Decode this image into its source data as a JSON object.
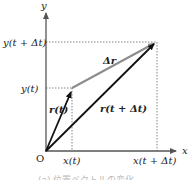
{
  "diagram": {
    "axes": {
      "x_label": "x",
      "y_label": "y",
      "origin_label": "O"
    },
    "ticks": {
      "x_t": "x(t)",
      "x_t_dt": "x(t + Δt)",
      "y_t": "y(t)",
      "y_t_dt": "y(t + Δt)"
    },
    "vectors": {
      "r_t": "r(t)",
      "r_t_dt": "r(t + Δt)",
      "delta_r": "Δr"
    },
    "colors": {
      "axis": "#555555",
      "vector": "#111111",
      "delta_vector": "#8c8c8c",
      "guide": "#555555"
    },
    "caption": "(a) 位置ベクトルの変化"
  }
}
